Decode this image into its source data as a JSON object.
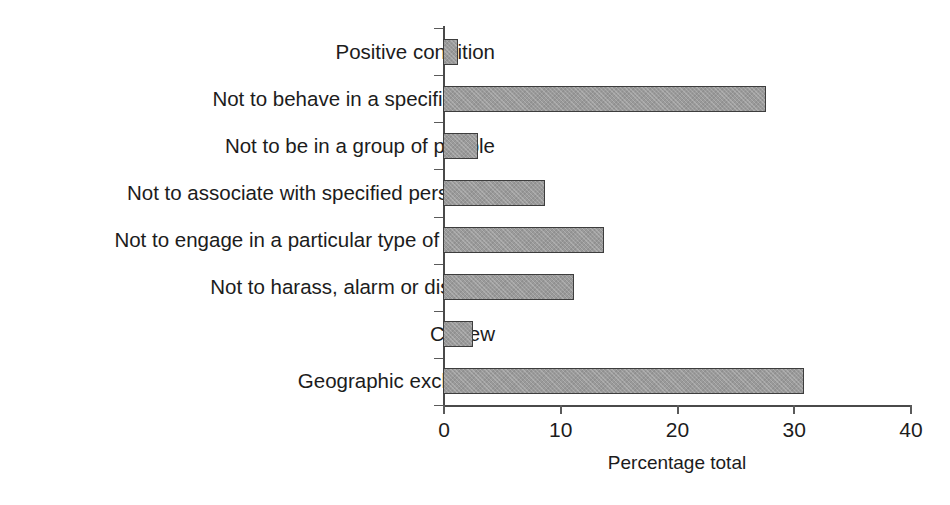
{
  "chart_data": {
    "type": "bar",
    "orientation": "horizontal",
    "title": "",
    "xlabel": "Percentage total",
    "ylabel": "",
    "xlim": [
      0,
      40
    ],
    "xticks": [
      0,
      10,
      20,
      30,
      40
    ],
    "xtick_labels": [
      "0",
      "10",
      "20",
      "30",
      "40"
    ],
    "grid": false,
    "legend": null,
    "bar_color": "#9a9a9a",
    "bar_edge_color": "#3d3d3d",
    "categories": [
      "Positive condition",
      "Not to behave in a specific way",
      "Not to be in a group of people",
      "Not to associate with specified person(s)",
      "Not to engage in a particular type of crime",
      "Not to harass, alarm or distress",
      "Curfew",
      "Geographic exclusion"
    ],
    "values": [
      1.3,
      27.7,
      3.0,
      8.7,
      13.8,
      11.2,
      2.6,
      30.9
    ]
  },
  "axis": {
    "x_label": "Percentage total",
    "tick_labels": [
      "0",
      "10",
      "20",
      "30",
      "40"
    ]
  }
}
